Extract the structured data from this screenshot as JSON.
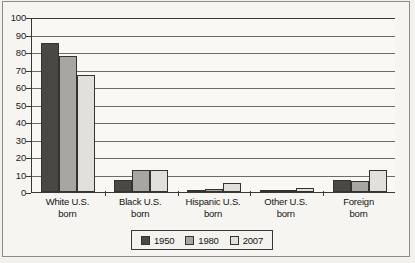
{
  "chart_data": {
    "type": "bar",
    "title": "",
    "xlabel": "",
    "ylabel": "",
    "ylim": [
      0,
      100
    ],
    "yticks": [
      0,
      10,
      20,
      30,
      40,
      50,
      60,
      70,
      80,
      90,
      100
    ],
    "ytick_labels": [
      "0",
      "10",
      "20",
      "30",
      "40",
      "50",
      "60",
      "70",
      "80",
      "90",
      "100"
    ],
    "grid": true,
    "grid_axis": "y",
    "legend_position": "bottom-center",
    "categories": [
      "White U.S. born",
      "Black U.S. born",
      "Hispanic U.S. born",
      "Other U.S. born",
      "Foreign born"
    ],
    "category_lines": [
      [
        "White U.S.",
        "born"
      ],
      [
        "Black U.S.",
        "born"
      ],
      [
        "Hispanic U.S.",
        "born"
      ],
      [
        "Other U.S.",
        "born"
      ],
      [
        "Foreign",
        "born"
      ]
    ],
    "series": [
      {
        "name": "1950",
        "color": "#4a4744",
        "values": [
          85,
          7,
          0.5,
          0.3,
          7
        ]
      },
      {
        "name": "1980",
        "color": "#a8a6a2",
        "values": [
          77.5,
          12.5,
          2,
          1,
          6.5
        ]
      },
      {
        "name": "2007",
        "color": "#e2e0dd",
        "values": [
          67,
          12.5,
          5,
          2.5,
          12.5
        ]
      }
    ]
  },
  "legend": {
    "items": [
      {
        "label": "1950",
        "color": "#4a4744"
      },
      {
        "label": "1980",
        "color": "#a8a6a2"
      },
      {
        "label": "2007",
        "color": "#e2e0dd"
      }
    ]
  }
}
